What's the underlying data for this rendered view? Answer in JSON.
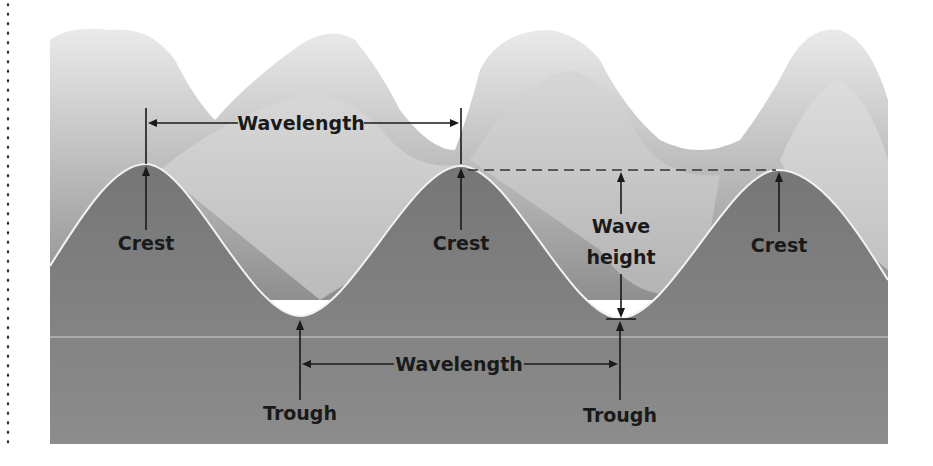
{
  "figure": {
    "type": "wave anatomy diagram",
    "labels": {
      "wavelength_top": "Wavelength",
      "wavelength_bottom": "Wavelength",
      "crest_1": "Crest",
      "crest_2": "Crest",
      "crest_3": "Crest",
      "wave_height_line1": "Wave",
      "wave_height_line2": "height",
      "trough_1": "Trough",
      "trough_2": "Trough"
    },
    "colors": {
      "water_body": "#7d7d7d",
      "water_body_lower": "#8a8a8a",
      "wave_surface_light": "#e6e6e6",
      "wave_surface_mid": "#b4b4b4",
      "wave_outline": "#f2f2f2",
      "annotation": "#1a1a1a",
      "background": "#ffffff"
    }
  }
}
